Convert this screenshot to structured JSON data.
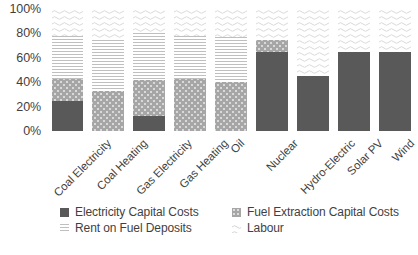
{
  "chart_data": {
    "type": "bar",
    "stacked": true,
    "title": "",
    "xlabel": "",
    "ylabel": "",
    "ylim": [
      0,
      100
    ],
    "y_unit": "%",
    "grid": false,
    "legend_position": "bottom",
    "y_ticks": [
      "0%",
      "20%",
      "40%",
      "60%",
      "80%",
      "100%"
    ],
    "y_tick_values": [
      0,
      20,
      40,
      60,
      80,
      100
    ],
    "categories": [
      "Coal Electricity",
      "Coal Heating",
      "Gas Electricity",
      "Gas Heating",
      "Oil",
      "Nuclear",
      "Hydro-Electric",
      "Solar PV",
      "Wind"
    ],
    "series": [
      {
        "name": "Electricity Capital Costs",
        "color": "#595959",
        "pattern": "solid",
        "values": [
          25,
          0,
          12,
          0,
          0,
          65,
          45,
          65,
          65
        ]
      },
      {
        "name": "Fuel Extraction Capital Costs",
        "color": "#a6a6a6",
        "pattern": "dots",
        "values": [
          18,
          33,
          30,
          43,
          40,
          10,
          0,
          0,
          0
        ]
      },
      {
        "name": "Rent on Fuel Deposits",
        "color": "#bfbfbf",
        "pattern": "horizontal-lines",
        "values": [
          35,
          42,
          38,
          35,
          37,
          0,
          0,
          0,
          0
        ]
      },
      {
        "name": "Labour",
        "color": "#e8e8e8",
        "pattern": "wavy",
        "values": [
          22,
          25,
          20,
          22,
          23,
          25,
          55,
          35,
          35
        ]
      }
    ]
  },
  "legend": {
    "items": [
      {
        "label": "Electricity Capital Costs",
        "swatch": "legend-swatch-electricity-capital-costs"
      },
      {
        "label": "Fuel Extraction Capital Costs",
        "swatch": "legend-swatch-fuel-extraction-capital-costs"
      },
      {
        "label": "Rent on Fuel Deposits",
        "swatch": "legend-swatch-rent-on-fuel-deposits"
      },
      {
        "label": "Labour",
        "swatch": "legend-swatch-labour"
      }
    ]
  }
}
